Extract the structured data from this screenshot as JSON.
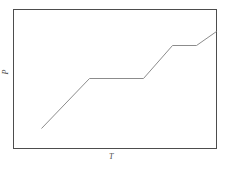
{
  "figure": {
    "background_color": "#ffffff",
    "frame_color": "#4d4d4d",
    "curve_color": "#8c8c8c",
    "label_color": "#4a4a4a"
  },
  "axes": {
    "x_label": "T",
    "y_label": "P",
    "x_label_name": "temperature-axis-label",
    "y_label_name": "pressure-axis-label",
    "frame": {
      "left": 13,
      "top": 9,
      "right": 216,
      "bottom": 148
    },
    "ticks_visible": false,
    "gridlines_visible": false
  },
  "chart_data": {
    "type": "line",
    "title": "",
    "subtitle": "",
    "xlabel": "T",
    "ylabel": "P",
    "xlim": [
      0,
      100
    ],
    "ylim": [
      0,
      100
    ],
    "grid": false,
    "legend": null,
    "series": [
      {
        "name": "P vs T staircase",
        "x": [
          13.8,
          37.4,
          64.0,
          78.3,
          90.1,
          100.0
        ],
        "y": [
          14.4,
          50.4,
          50.4,
          74.1,
          74.1,
          84.2
        ],
        "points_px": [
          {
            "x": 41,
            "y": 128
          },
          {
            "x": 89,
            "y": 78
          },
          {
            "x": 143,
            "y": 78
          },
          {
            "x": 172,
            "y": 45
          },
          {
            "x": 196,
            "y": 45
          },
          {
            "x": 216,
            "y": 31
          }
        ],
        "description": "Monotonic rising curve with two horizontal plateaus",
        "color": "#8c8c8c",
        "line_width": 1,
        "markers": false
      }
    ],
    "annotations": []
  }
}
